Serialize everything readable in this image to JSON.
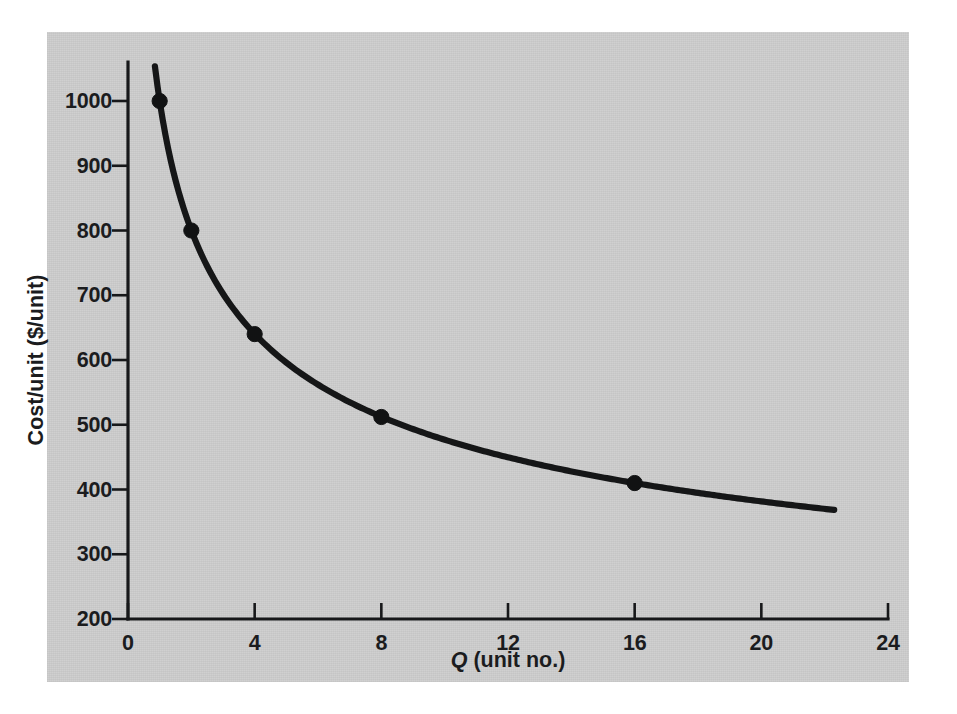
{
  "figure": {
    "background_color": "#cfcfcf",
    "page_color": "#ffffff",
    "ink_color": "#151617"
  },
  "chart_data": {
    "type": "line",
    "title": "",
    "subtitle": "",
    "xlabel_prefix": "Q",
    "xlabel_suffix": " (unit no.)",
    "xlabel": "Q (unit no.)",
    "ylabel": "Cost/unit ($/unit)",
    "xlim": [
      0,
      24
    ],
    "ylim": [
      200,
      1000
    ],
    "grid": false,
    "legend": null,
    "x_ticks": [
      0,
      4,
      8,
      12,
      16,
      20,
      24
    ],
    "x_tick_labels": [
      "0",
      "4",
      "8",
      "12",
      "16",
      "20",
      "24"
    ],
    "y_ticks": [
      200,
      300,
      400,
      500,
      600,
      700,
      800,
      900,
      1000
    ],
    "y_tick_labels": [
      "200",
      "300",
      "400",
      "500",
      "600",
      "700",
      "800",
      "900",
      "1000"
    ],
    "series": [
      {
        "name": "Learning curve (80%)",
        "marker": "filled-circle",
        "x": [
          1,
          2,
          4,
          8,
          16
        ],
        "values": [
          1000,
          800,
          640,
          512,
          410
        ],
        "points": [
          {
            "x": 1,
            "y": 1000
          },
          {
            "x": 2,
            "y": 800
          },
          {
            "x": 4,
            "y": 640
          },
          {
            "x": 8,
            "y": 512
          },
          {
            "x": 16,
            "y": 410
          }
        ],
        "curve_start": {
          "x": 0.85,
          "y": 1053
        },
        "curve_end": {
          "x": 22.3,
          "y": 352
        }
      }
    ],
    "annotations": []
  }
}
